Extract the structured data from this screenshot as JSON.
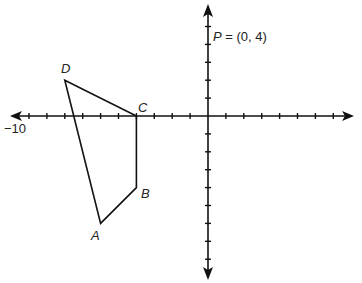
{
  "diagram": {
    "type": "coordinate-plane",
    "origin_px": [
      208,
      116
    ],
    "unit_px": 17.9,
    "x_axis_label": "−10",
    "point_p_label": "P = (0, 4)",
    "vertices": [
      {
        "name": "A",
        "x": -6,
        "y": -6
      },
      {
        "name": "B",
        "x": -4,
        "y": -4
      },
      {
        "name": "C",
        "x": -4,
        "y": 0
      },
      {
        "name": "D",
        "x": -8,
        "y": 2
      }
    ],
    "labels": {
      "A": "A",
      "B": "B",
      "C": "C",
      "D": "D",
      "P": "P",
      "P_value": "= (0, 4)"
    }
  }
}
